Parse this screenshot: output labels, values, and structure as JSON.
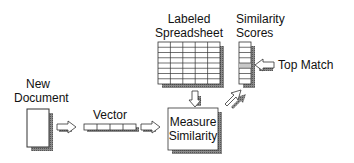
{
  "diagram": {
    "type": "flow",
    "nodes": {
      "new_document": {
        "label_line1": "New",
        "label_line2": "Document"
      },
      "vector": {
        "label": "Vector",
        "cells": 4
      },
      "labeled_spreadsheet": {
        "label_line1": "Labeled",
        "label_line2": "Spreadsheet",
        "rows": 8,
        "cols": 5
      },
      "similarity_scores": {
        "label_line1": "Similarity",
        "label_line2": "Scores",
        "rows": 8,
        "highlighted_row": 4
      },
      "measure_similarity": {
        "label_line1": "Measure",
        "label_line2": "Similarity"
      },
      "top_match": {
        "label": "Top Match"
      }
    },
    "edges": [
      {
        "from": "new_document",
        "to": "vector"
      },
      {
        "from": "vector",
        "to": "measure_similarity"
      },
      {
        "from": "labeled_spreadsheet",
        "to": "measure_similarity"
      },
      {
        "from": "measure_similarity",
        "to": "similarity_scores"
      },
      {
        "from": "top_match",
        "to": "similarity_scores"
      }
    ],
    "colors": {
      "shadow": "#7a7a7a",
      "highlight": "#c8c8c8",
      "stroke": "#333333"
    }
  }
}
